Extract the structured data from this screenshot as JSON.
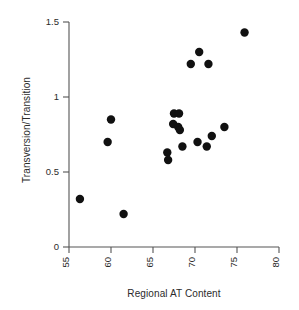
{
  "chart_data": {
    "type": "scatter",
    "title": "",
    "xlabel": "Regional AT Content",
    "ylabel": "Transversion/Transition",
    "xlim": [
      55,
      80
    ],
    "ylim": [
      0,
      1.5
    ],
    "xticks": [
      55,
      60,
      65,
      70,
      75,
      80
    ],
    "yticks": [
      0,
      0.5,
      1,
      1.5
    ],
    "xtick_labels": [
      "55",
      "60",
      "65",
      "70",
      "75",
      "80"
    ],
    "ytick_labels": [
      "0",
      "0.5",
      "1",
      "1.5"
    ],
    "xtick_rotation": 90,
    "grid": false,
    "legend": false,
    "marker": "filled-circle",
    "marker_color": "#111111",
    "marker_size": 4.2,
    "points": [
      {
        "x": 56.3,
        "y": 0.32
      },
      {
        "x": 59.6,
        "y": 0.7
      },
      {
        "x": 60.0,
        "y": 0.85
      },
      {
        "x": 61.5,
        "y": 0.22
      },
      {
        "x": 66.7,
        "y": 0.63
      },
      {
        "x": 66.8,
        "y": 0.58
      },
      {
        "x": 67.4,
        "y": 0.82
      },
      {
        "x": 67.5,
        "y": 0.89
      },
      {
        "x": 68.1,
        "y": 0.89
      },
      {
        "x": 68.0,
        "y": 0.8
      },
      {
        "x": 68.2,
        "y": 0.78
      },
      {
        "x": 68.5,
        "y": 0.67
      },
      {
        "x": 69.5,
        "y": 1.22
      },
      {
        "x": 70.5,
        "y": 1.3
      },
      {
        "x": 70.3,
        "y": 0.7
      },
      {
        "x": 71.6,
        "y": 1.22
      },
      {
        "x": 71.4,
        "y": 0.67
      },
      {
        "x": 72.0,
        "y": 0.74
      },
      {
        "x": 73.5,
        "y": 0.8
      },
      {
        "x": 75.9,
        "y": 1.43
      }
    ]
  },
  "figure": {
    "background_color": "#ffffff",
    "axis_color": "#555555",
    "text_color": "#2b2b2b"
  }
}
